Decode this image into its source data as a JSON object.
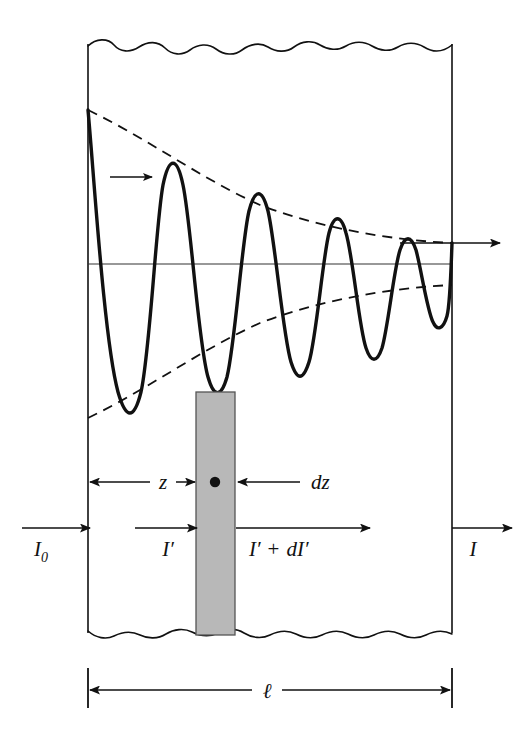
{
  "figure": {
    "name": "beer-lambert-absorption-diagram"
  },
  "labels": {
    "incident_intensity": "I",
    "incident_intensity_subscript": "0",
    "interior_intensity": "I′",
    "exit_element_intensity_left": "I′",
    "exit_element_intensity_op": "+",
    "exit_element_intensity_right": "dI′",
    "transmitted_intensity": "I",
    "depth": "z",
    "element_thickness": "dz",
    "slab_thickness": "ℓ"
  },
  "geometry": {
    "left_boundary_x": 88,
    "right_boundary_x": 452,
    "top_edge_y": 42,
    "bottom_edge_y": 635,
    "axis_y": 264,
    "slab_left_x": 196,
    "slab_right_x": 235,
    "dimension_line_y": 690,
    "wave_start_y": 110,
    "wave_peaks": 6,
    "wavelength_px": 62
  },
  "colors": {
    "stroke": "#111111",
    "slab_fill": "#b8b8b8",
    "slab_edge": "#555555",
    "background": "#ffffff",
    "axis": "#333333"
  },
  "wave_data": {
    "type": "line",
    "description": "Exponentially damped sinusoid representing wave amplitude decaying with penetration depth",
    "envelope": "exponential decay",
    "amplitude_start": 154,
    "amplitude_end": 24,
    "oscillation_cycles": 6,
    "direction": "left-to-right"
  },
  "arrows": {
    "propagation_arrow": "propagation-direction",
    "incident_arrow": "incident-beam-arrow",
    "interior_arrow": "interior-beam-arrow",
    "exit_element_arrow": "element-exit-beam-arrow",
    "transmitted_arrow": "transmitted-beam-arrow",
    "wave_exit_arrow": "wave-exit-arrow"
  }
}
